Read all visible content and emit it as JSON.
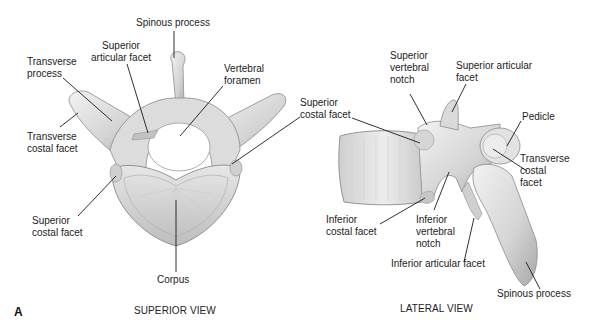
{
  "figure": {
    "panel_letter": "A",
    "superior_view": {
      "caption": "SUPERIOR VIEW",
      "labels": {
        "spinous_process": "Spinous process",
        "superior_articular_facet": "Superior\narticular facet",
        "transverse_process": "Transverse\nprocess",
        "vertebral_foramen": "Vertebral\nforamen",
        "transverse_costal_facet": "Transverse\ncostal facet",
        "superior_costal_facet_left": "Superior\ncostal facet",
        "corpus": "Corpus"
      }
    },
    "lateral_view": {
      "caption": "LATERAL VIEW",
      "labels": {
        "superior_costal_facet": "Superior\ncostal facet",
        "superior_vertebral_notch": "Superior\nvertebral\nnotch",
        "superior_articular_facet": "Superior articular\nfacet",
        "pedicle": "Pedicle",
        "transverse_costal_facet": "Transverse\ncostal\nfacet",
        "inferior_costal_facet": "Inferior\ncostal facet",
        "inferior_vertebral_notch": "Inferior\nvertebral\nnotch",
        "inferior_articular_facet": "Inferior articular facet",
        "spinous_process": "Spinous process"
      }
    },
    "colors": {
      "bone_light": "#ebebeb",
      "bone_mid": "#c9c9c9",
      "bone_dark": "#9a9a9a",
      "leader_line": "#1a1a1a"
    }
  }
}
